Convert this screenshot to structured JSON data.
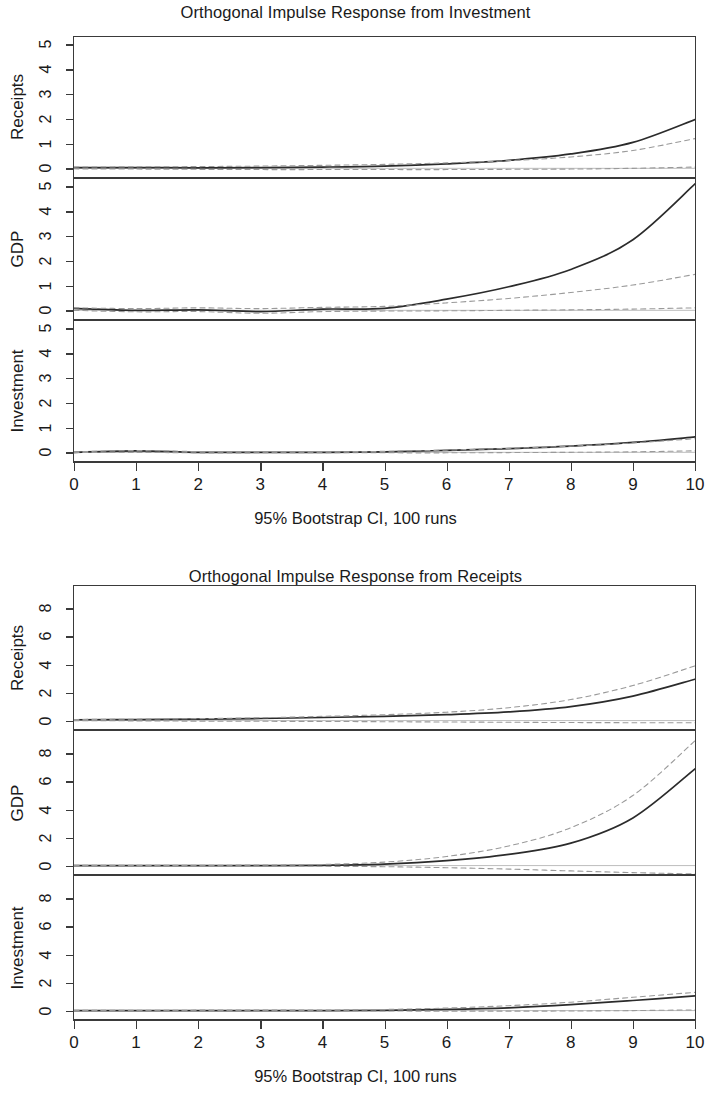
{
  "figures": [
    {
      "id": "figure-1",
      "title": "Orthogonal Impulse Response from Investment",
      "caption": "95% Bootstrap CI, 100 runs",
      "xaxis": {
        "label": "",
        "ticks": [
          "0",
          "1",
          "2",
          "3",
          "4",
          "5",
          "6",
          "7",
          "8",
          "9",
          "10"
        ]
      },
      "panels": [
        {
          "name": "Receipts",
          "yticks": [
            "0",
            "1",
            "2",
            "3",
            "4",
            "5"
          ]
        },
        {
          "name": "GDP",
          "yticks": [
            "0",
            "1",
            "2",
            "3",
            "4",
            "5"
          ]
        },
        {
          "name": "Investment",
          "yticks": [
            "0",
            "1",
            "2",
            "3",
            "4",
            "5"
          ]
        }
      ]
    },
    {
      "id": "figure-2",
      "title": "Orthogonal Impulse Response from Receipts",
      "caption": "95% Bootstrap CI, 100 runs",
      "xaxis": {
        "label": "",
        "ticks": [
          "0",
          "1",
          "2",
          "3",
          "4",
          "5",
          "6",
          "7",
          "8",
          "9",
          "10"
        ]
      },
      "panels": [
        {
          "name": "Receipts",
          "yticks": [
            "0",
            "2",
            "4",
            "6",
            "8"
          ]
        },
        {
          "name": "GDP",
          "yticks": [
            "0",
            "2",
            "4",
            "6",
            "8"
          ]
        },
        {
          "name": "Investment",
          "yticks": [
            "0",
            "2",
            "4",
            "6",
            "8"
          ]
        }
      ]
    }
  ],
  "colors": {
    "line": "#2b2b2b",
    "ci": "#9a9a9a",
    "zero": "#bdbdbd",
    "axis": "#3a3a3a",
    "text": "#1a1a1a"
  },
  "chart_data": [
    {
      "type": "line",
      "title": "Orthogonal Impulse Response from Investment",
      "xlabel": "95% Bootstrap CI, 100 runs",
      "x": [
        0,
        1,
        2,
        3,
        4,
        5,
        6,
        7,
        8,
        9,
        10
      ],
      "xlim": [
        0,
        10
      ],
      "grid": false,
      "legend": "none",
      "panels": [
        {
          "ylabel": "Receipts",
          "ylim": [
            -0.35,
            5.3
          ],
          "yticks": [
            0,
            1,
            2,
            3,
            4,
            5
          ],
          "series": [
            {
              "name": "irf",
              "style": "solid",
              "values": [
                0.03,
                0.03,
                0.02,
                0.03,
                0.05,
                0.09,
                0.18,
                0.32,
                0.58,
                1.05,
                1.97
              ]
            },
            {
              "name": "ci_upper",
              "style": "dashed",
              "values": [
                0.05,
                0.06,
                0.07,
                0.09,
                0.12,
                0.16,
                0.22,
                0.31,
                0.46,
                0.72,
                1.2
              ]
            },
            {
              "name": "ci_lower",
              "style": "dashed",
              "values": [
                -0.02,
                -0.03,
                -0.04,
                -0.05,
                -0.05,
                -0.05,
                -0.05,
                -0.04,
                -0.03,
                0.0,
                0.05
              ]
            }
          ]
        },
        {
          "ylabel": "GDP",
          "ylim": [
            -0.35,
            5.3
          ],
          "yticks": [
            0,
            1,
            2,
            3,
            4,
            5
          ],
          "series": [
            {
              "name": "irf",
              "style": "solid",
              "values": [
                0.08,
                0.0,
                0.02,
                -0.05,
                0.05,
                0.08,
                0.45,
                0.95,
                1.65,
                2.85,
                5.1
              ]
            },
            {
              "name": "ci_upper",
              "style": "dashed",
              "values": [
                0.1,
                0.07,
                0.1,
                0.07,
                0.12,
                0.16,
                0.3,
                0.48,
                0.72,
                1.02,
                1.45
              ]
            },
            {
              "name": "ci_lower",
              "style": "dashed",
              "values": [
                0.0,
                -0.06,
                -0.05,
                -0.12,
                -0.05,
                -0.03,
                -0.02,
                0.0,
                0.02,
                0.05,
                0.1
              ]
            }
          ]
        },
        {
          "ylabel": "Investment",
          "ylim": [
            -0.35,
            5.3
          ],
          "yticks": [
            0,
            1,
            2,
            3,
            4,
            5
          ],
          "series": [
            {
              "name": "irf",
              "style": "solid",
              "values": [
                0.0,
                0.06,
                0.0,
                0.0,
                0.0,
                0.02,
                0.08,
                0.15,
                0.25,
                0.4,
                0.62
              ]
            },
            {
              "name": "ci_upper",
              "style": "dashed",
              "values": [
                0.02,
                0.07,
                0.03,
                0.02,
                0.02,
                0.04,
                0.09,
                0.16,
                0.25,
                0.38,
                0.55
              ]
            },
            {
              "name": "ci_lower",
              "style": "dashed",
              "values": [
                -0.01,
                0.0,
                -0.02,
                -0.02,
                -0.02,
                -0.02,
                -0.02,
                -0.01,
                0.0,
                0.02,
                0.06
              ]
            }
          ]
        }
      ]
    },
    {
      "type": "line",
      "title": "Orthogonal Impulse Response from Receipts",
      "xlabel": "95% Bootstrap CI, 100 runs",
      "x": [
        0,
        1,
        2,
        3,
        4,
        5,
        6,
        7,
        8,
        9,
        10
      ],
      "xlim": [
        0,
        10
      ],
      "grid": false,
      "legend": "none",
      "panels": [
        {
          "ylabel": "Receipts",
          "ylim": [
            -0.6,
            9.6
          ],
          "yticks": [
            0,
            2,
            4,
            6,
            8
          ],
          "series": [
            {
              "name": "irf",
              "style": "solid",
              "values": [
                0.06,
                0.07,
                0.1,
                0.15,
                0.22,
                0.3,
                0.42,
                0.62,
                1.0,
                1.75,
                2.95
              ]
            },
            {
              "name": "ci_upper",
              "style": "dashed",
              "values": [
                0.08,
                0.1,
                0.14,
                0.2,
                0.3,
                0.42,
                0.6,
                0.92,
                1.5,
                2.5,
                3.9
              ]
            },
            {
              "name": "ci_lower",
              "style": "dashed",
              "values": [
                0.0,
                -0.02,
                -0.04,
                -0.05,
                -0.06,
                -0.08,
                -0.1,
                -0.12,
                -0.14,
                -0.15,
                -0.15
              ]
            }
          ]
        },
        {
          "ylabel": "GDP",
          "ylim": [
            -0.6,
            9.6
          ],
          "yticks": [
            0,
            2,
            4,
            6,
            8
          ],
          "series": [
            {
              "name": "irf",
              "style": "solid",
              "values": [
                0.0,
                0.0,
                0.0,
                0.0,
                0.02,
                0.1,
                0.35,
                0.8,
                1.6,
                3.4,
                6.9
              ]
            },
            {
              "name": "ci_upper",
              "style": "dashed",
              "values": [
                0.02,
                0.02,
                0.02,
                0.04,
                0.08,
                0.25,
                0.65,
                1.4,
                2.7,
                5.0,
                8.9
              ]
            },
            {
              "name": "ci_lower",
              "style": "dashed",
              "values": [
                0.0,
                0.0,
                -0.02,
                -0.03,
                -0.05,
                -0.08,
                -0.15,
                -0.25,
                -0.38,
                -0.5,
                -0.6
              ]
            }
          ]
        },
        {
          "ylabel": "Investment",
          "ylim": [
            -0.6,
            9.6
          ],
          "yticks": [
            0,
            2,
            4,
            6,
            8
          ],
          "series": [
            {
              "name": "irf",
              "style": "solid",
              "values": [
                0.0,
                0.0,
                0.0,
                0.0,
                0.0,
                0.02,
                0.08,
                0.2,
                0.42,
                0.72,
                1.05
              ]
            },
            {
              "name": "ci_upper",
              "style": "dashed",
              "values": [
                0.02,
                0.02,
                0.03,
                0.03,
                0.04,
                0.08,
                0.18,
                0.35,
                0.6,
                0.95,
                1.3
              ]
            },
            {
              "name": "ci_lower",
              "style": "dashed",
              "values": [
                0.0,
                -0.01,
                -0.02,
                -0.02,
                -0.02,
                -0.03,
                -0.04,
                -0.04,
                -0.03,
                0.0,
                0.05
              ]
            }
          ]
        }
      ]
    }
  ]
}
